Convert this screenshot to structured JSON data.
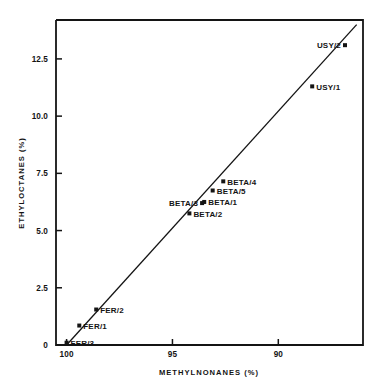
{
  "chart_data": {
    "type": "scatter",
    "title": "",
    "xlabel": "METHYLNONANES (%)",
    "ylabel": "ETHYLOCTANES (%)",
    "xlim": [
      100.5,
      86.0
    ],
    "ylim": [
      0,
      14.2
    ],
    "x_ticks": [
      {
        "value": 100,
        "label": "100"
      },
      {
        "value": 95,
        "label": "95"
      },
      {
        "value": 90,
        "label": "90"
      }
    ],
    "y_ticks": [
      {
        "value": 0,
        "label": "0"
      },
      {
        "value": 2.5,
        "label": "2.5"
      },
      {
        "value": 5.0,
        "label": "5.0"
      },
      {
        "value": 7.5,
        "label": "7.5"
      },
      {
        "value": 10.0,
        "label": "10.0"
      },
      {
        "value": 12.5,
        "label": "12.5"
      }
    ],
    "grid": false,
    "legend": "none",
    "marker_color": "#141414",
    "line_color": "#141414",
    "trend_line": {
      "label": "correlation line",
      "x_start": 100.0,
      "y_start": 0.0,
      "x_end": 86.3,
      "y_end": 14.0
    },
    "points": [
      {
        "name": "FER/3",
        "x": 100.0,
        "y": 0.1,
        "label": "FER/3",
        "label_side": "right"
      },
      {
        "name": "FER/1",
        "x": 99.4,
        "y": 0.85,
        "label": "FER/1",
        "label_side": "right"
      },
      {
        "name": "FER/2",
        "x": 98.6,
        "y": 1.55,
        "label": "FER/2",
        "label_side": "right"
      },
      {
        "name": "BETA/2",
        "x": 94.2,
        "y": 5.75,
        "label": "BETA/2",
        "label_side": "right"
      },
      {
        "name": "BETA/3",
        "x": 93.6,
        "y": 6.2,
        "label": "BETA/3",
        "label_side": "left"
      },
      {
        "name": "BETA/1",
        "x": 93.5,
        "y": 6.25,
        "label": "BETA/1",
        "label_side": "right"
      },
      {
        "name": "BETA/5",
        "x": 93.1,
        "y": 6.75,
        "label": "BETA/5",
        "label_side": "right"
      },
      {
        "name": "BETA/4",
        "x": 92.6,
        "y": 7.15,
        "label": "BETA/4",
        "label_side": "right"
      },
      {
        "name": "USY/1",
        "x": 88.4,
        "y": 11.3,
        "label": "USY/1",
        "label_side": "right"
      },
      {
        "name": "USY/2",
        "x": 86.85,
        "y": 13.1,
        "label": "USY/2",
        "label_side": "left"
      }
    ]
  }
}
